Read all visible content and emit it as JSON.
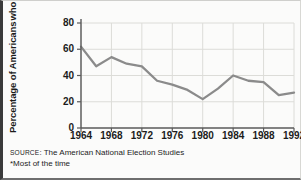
{
  "chart_data": {
    "type": "line",
    "title": "",
    "ylabel_lines": [
      "Percentage of Americans",
      "who trust the federal",
      "government*"
    ],
    "ylabel": "Percentage of Americans who trust the federal government*",
    "xlabel": "",
    "ylim": [
      0,
      80
    ],
    "yticks": [
      0,
      20,
      40,
      60,
      80
    ],
    "xlim": [
      1964,
      1992
    ],
    "xticks": [
      1964,
      1968,
      1972,
      1976,
      1980,
      1984,
      1988,
      1992
    ],
    "xtick_labels": [
      "1964",
      "1968",
      "1972",
      "1976",
      "1980",
      "1984",
      "1988",
      "1992"
    ],
    "grid": "horizontal-and-vertical",
    "legend": "none",
    "line_color": "#8b8b8b",
    "x": [
      1964,
      1966,
      1968,
      1970,
      1972,
      1974,
      1976,
      1978,
      1980,
      1982,
      1984,
      1986,
      1988,
      1990,
      1992
    ],
    "values": [
      62,
      47,
      54,
      49,
      47,
      36,
      33,
      29,
      22,
      30,
      40,
      36,
      35,
      25,
      27
    ],
    "series": [
      {
        "name": "Trust the federal government (most of the time)",
        "values": [
          62,
          47,
          54,
          49,
          47,
          36,
          33,
          29,
          22,
          30,
          40,
          36,
          35,
          25,
          27
        ]
      }
    ]
  },
  "notes": {
    "source_prefix": "SOURCE",
    "source_text": ": The American National Election Studies",
    "footnote": "*Most of the time"
  },
  "colors": {
    "line": "#8b8b8b",
    "axis": "#5a5a5a",
    "grid": "#dcdcd8",
    "text": "#1b1b1b",
    "background": "#fbfbfa"
  }
}
